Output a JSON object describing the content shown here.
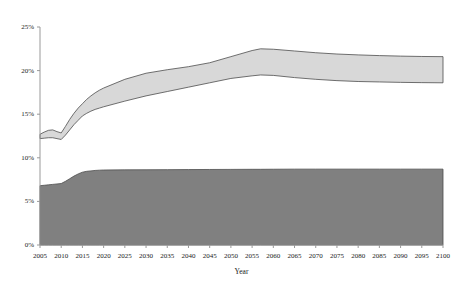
{
  "chart_data": {
    "type": "area",
    "title": "",
    "subtitle": "",
    "xlabel": "Year",
    "ylabel": "",
    "grid": false,
    "legend_position": "none",
    "xlim": [
      2005,
      2100
    ],
    "ylim": [
      0,
      25
    ],
    "x_tick_labels": [
      "2005",
      "2010",
      "2015",
      "2020",
      "2025",
      "2030",
      "2035",
      "2040",
      "2045",
      "2050",
      "2055",
      "2060",
      "2065",
      "2070",
      "2075",
      "2080",
      "2085",
      "2090",
      "2095",
      "2100"
    ],
    "x_tick_values": [
      2005,
      2010,
      2015,
      2020,
      2025,
      2030,
      2035,
      2040,
      2045,
      2050,
      2055,
      2060,
      2065,
      2070,
      2075,
      2080,
      2085,
      2090,
      2095,
      2100
    ],
    "y_tick_labels": [
      "0%",
      "5%",
      "10%",
      "15%",
      "20%",
      "25%"
    ],
    "y_tick_values": [
      0,
      5,
      10,
      15,
      20,
      25
    ],
    "y_unit": "%",
    "colors": {
      "lower_band_fill": "#808080",
      "upper_band_fill": "#d8d8d8",
      "band_outline": "#4d4d4d",
      "axis": "#999999",
      "text": "#1a1a1a",
      "background": "#ffffff"
    },
    "x": [
      2005,
      2006,
      2007,
      2008,
      2009,
      2010,
      2011,
      2012,
      2013,
      2014,
      2015,
      2016,
      2017,
      2018,
      2019,
      2020,
      2025,
      2030,
      2035,
      2040,
      2045,
      2050,
      2055,
      2057,
      2060,
      2065,
      2070,
      2075,
      2080,
      2085,
      2090,
      2095,
      2100
    ],
    "series": [
      {
        "name": "lower-band-upper-edge",
        "role": "boundary",
        "values": [
          6.8,
          6.85,
          6.9,
          6.95,
          7.0,
          7.05,
          7.3,
          7.6,
          7.9,
          8.15,
          8.35,
          8.45,
          8.5,
          8.55,
          8.58,
          8.6,
          8.62,
          8.63,
          8.64,
          8.65,
          8.66,
          8.67,
          8.68,
          8.68,
          8.69,
          8.7,
          8.7,
          8.7,
          8.7,
          8.7,
          8.7,
          8.7,
          8.7
        ]
      },
      {
        "name": "lower-band-lower-edge",
        "role": "boundary",
        "values": [
          0,
          0,
          0,
          0,
          0,
          0,
          0,
          0,
          0,
          0,
          0,
          0,
          0,
          0,
          0,
          0,
          0,
          0,
          0,
          0,
          0,
          0,
          0,
          0,
          0,
          0,
          0,
          0,
          0,
          0,
          0,
          0,
          0
        ]
      },
      {
        "name": "upper-band-lower-edge",
        "role": "boundary",
        "values": [
          12.2,
          12.25,
          12.3,
          12.3,
          12.2,
          12.1,
          12.6,
          13.2,
          13.8,
          14.3,
          14.8,
          15.1,
          15.35,
          15.55,
          15.7,
          15.85,
          16.5,
          17.1,
          17.6,
          18.1,
          18.6,
          19.1,
          19.4,
          19.5,
          19.45,
          19.2,
          19.0,
          18.85,
          18.75,
          18.7,
          18.65,
          18.62,
          18.6
        ]
      },
      {
        "name": "upper-band-upper-edge",
        "role": "boundary",
        "values": [
          12.7,
          12.95,
          13.15,
          13.2,
          13.0,
          12.85,
          13.6,
          14.4,
          15.1,
          15.7,
          16.2,
          16.7,
          17.1,
          17.45,
          17.75,
          18.0,
          19.0,
          19.7,
          20.1,
          20.45,
          20.9,
          21.6,
          22.3,
          22.5,
          22.45,
          22.25,
          22.05,
          21.9,
          21.8,
          21.72,
          21.66,
          21.62,
          21.6
        ]
      }
    ],
    "bands": [
      {
        "name": "lower-shaded-band",
        "fill": "#808080",
        "from_series": "lower-band-lower-edge",
        "to_series": "lower-band-upper-edge"
      },
      {
        "name": "upper-shaded-band",
        "fill": "#d8d8d8",
        "from_series": "upper-band-lower-edge",
        "to_series": "upper-band-upper-edge"
      }
    ],
    "geometry": {
      "plot_left": 40,
      "plot_right": 443,
      "plot_top": 27,
      "plot_bottom": 245
    }
  }
}
